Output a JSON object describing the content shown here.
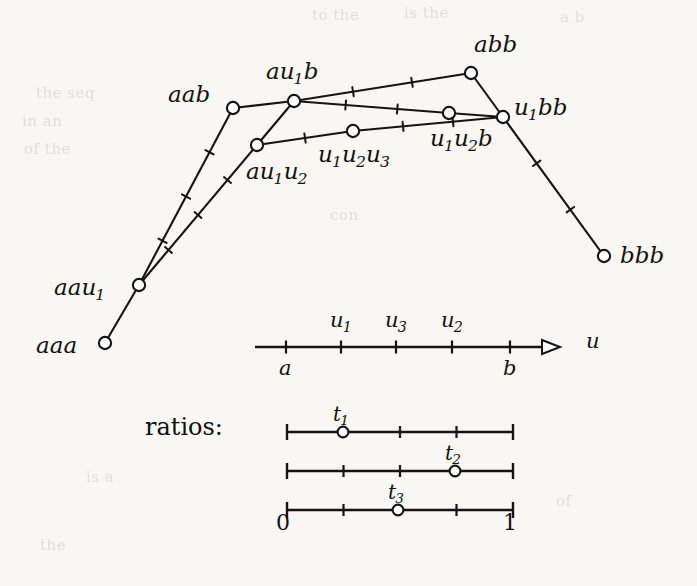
{
  "figure": {
    "ink_color": "#141414",
    "background_color": "#f8f7f4",
    "node_fill": "#ffffff"
  },
  "ghost_text": [
    {
      "text": "to the",
      "x": 312,
      "y": 6
    },
    {
      "text": "is the",
      "x": 404,
      "y": 4
    },
    {
      "text": "a b",
      "x": 560,
      "y": 8
    },
    {
      "text": "the seq",
      "x": 36,
      "y": 84
    },
    {
      "text": "in an",
      "x": 22,
      "y": 112
    },
    {
      "text": "of the",
      "x": 24,
      "y": 140
    },
    {
      "text": "con",
      "x": 330,
      "y": 206
    },
    {
      "text": "is a",
      "x": 86,
      "y": 468
    },
    {
      "text": "of",
      "x": 556,
      "y": 492
    },
    {
      "text": "the",
      "x": 40,
      "y": 536
    }
  ],
  "polygon": {
    "nodes": [
      {
        "id": "aaa",
        "x": 105,
        "y": 343,
        "label": "aaa",
        "sub": null,
        "tail": null,
        "lx": 36,
        "ly": 334,
        "anchor": "left"
      },
      {
        "id": "aau1",
        "x": 139,
        "y": 285,
        "label": "aau",
        "sub": "1",
        "tail": null,
        "lx": 54,
        "ly": 276,
        "anchor": "left"
      },
      {
        "id": "aab",
        "x": 233,
        "y": 108,
        "label": "aab",
        "sub": null,
        "tail": null,
        "lx": 168,
        "ly": 83,
        "anchor": "left"
      },
      {
        "id": "au1b",
        "x": 294,
        "y": 101,
        "label": "au",
        "sub": "1",
        "tail": "b",
        "lx": 266,
        "ly": 60,
        "anchor": "left"
      },
      {
        "id": "au1u2",
        "x": 257,
        "y": 145,
        "label": "au",
        "sub": "1",
        "tail": "u",
        "tailsub": "2",
        "lx": 246,
        "ly": 160,
        "anchor": "left"
      },
      {
        "id": "u1u2u3",
        "x": 353,
        "y": 131,
        "label": "u",
        "sub": "1",
        "tail": "u",
        "tailsub": "2",
        "tail2": "u",
        "tail2sub": "3",
        "lx": 318,
        "ly": 143,
        "anchor": "left"
      },
      {
        "id": "u1u2b",
        "x": 449,
        "y": 113,
        "label": "u",
        "sub": "1",
        "tail": "u",
        "tailsub": "2",
        "tail2": "b",
        "lx": 430,
        "ly": 127,
        "anchor": "left"
      },
      {
        "id": "abb",
        "x": 471,
        "y": 73,
        "label": "abb",
        "sub": null,
        "tail": null,
        "lx": 474,
        "ly": 33,
        "anchor": "left"
      },
      {
        "id": "u1bb",
        "x": 503,
        "y": 117,
        "label": "u",
        "sub": "1",
        "tail": "bb",
        "lx": 514,
        "ly": 96,
        "anchor": "left"
      },
      {
        "id": "bbb",
        "x": 604,
        "y": 256,
        "label": "bbb",
        "sub": null,
        "tail": null,
        "lx": 620,
        "ly": 244,
        "anchor": "left"
      }
    ],
    "edges": [
      {
        "from": "aaa",
        "to": "aau1",
        "ticks": 0
      },
      {
        "from": "aau1",
        "to": "aab",
        "ticks": 3
      },
      {
        "from": "aau1",
        "to": "au1u2",
        "ticks": 3
      },
      {
        "from": "aab",
        "to": "au1b",
        "ticks": 0
      },
      {
        "from": "au1u2",
        "to": "au1b",
        "ticks": 0
      },
      {
        "from": "au1b",
        "to": "abb",
        "ticks": 2
      },
      {
        "from": "au1b",
        "to": "u1u2b",
        "ticks": 2
      },
      {
        "from": "au1u2",
        "to": "u1u2u3",
        "ticks": 1
      },
      {
        "from": "u1u2u3",
        "to": "u1bb",
        "ticks": 2
      },
      {
        "from": "u1u2b",
        "to": "u1bb",
        "ticks": 0
      },
      {
        "from": "abb",
        "to": "u1bb",
        "ticks": 0
      },
      {
        "from": "u1bb",
        "to": "bbb",
        "ticks": 2
      }
    ]
  },
  "u_axis": {
    "y": 347,
    "x_start": 255,
    "x_end": 560,
    "arrow": true,
    "axis_label": "u",
    "axis_label_x": 586,
    "axis_label_y": 331,
    "ticks": [
      {
        "x": 286,
        "label": "a",
        "sub": null,
        "position": "below",
        "lx": 279,
        "ly": 358
      },
      {
        "x": 341,
        "label": "u",
        "sub": "1",
        "position": "above",
        "lx": 330,
        "ly": 310
      },
      {
        "x": 396,
        "label": "u",
        "sub": "3",
        "position": "above",
        "lx": 385,
        "ly": 310
      },
      {
        "x": 452,
        "label": "u",
        "sub": "2",
        "position": "above",
        "lx": 441,
        "ly": 310
      },
      {
        "x": 510,
        "label": "b",
        "sub": null,
        "position": "below",
        "lx": 503,
        "ly": 358
      }
    ]
  },
  "ratios": {
    "caption": "ratios:",
    "caption_x": 145,
    "caption_y": 413,
    "x_start": 287,
    "x_end": 513,
    "scale_min_label": "0",
    "scale_max_label": "1",
    "min_label_x": 276,
    "max_label_x": 503,
    "labels_y": 512,
    "lines": [
      {
        "y": 432,
        "marker_label": "t",
        "marker_sub": "1",
        "marker_value": 0.25,
        "marker_x": 343,
        "label_x": 333,
        "label_y": 404,
        "ticks": [
          0.5,
          0.75
        ]
      },
      {
        "y": 471,
        "marker_label": "t",
        "marker_sub": "2",
        "marker_value": 0.74,
        "marker_x": 455,
        "label_x": 445,
        "label_y": 443,
        "ticks": [
          0.25,
          0.5
        ]
      },
      {
        "y": 510,
        "marker_label": "t",
        "marker_sub": "3",
        "marker_value": 0.5,
        "marker_x": 398,
        "label_x": 388,
        "label_y": 482,
        "ticks": [
          0.25,
          0.75
        ]
      }
    ]
  }
}
